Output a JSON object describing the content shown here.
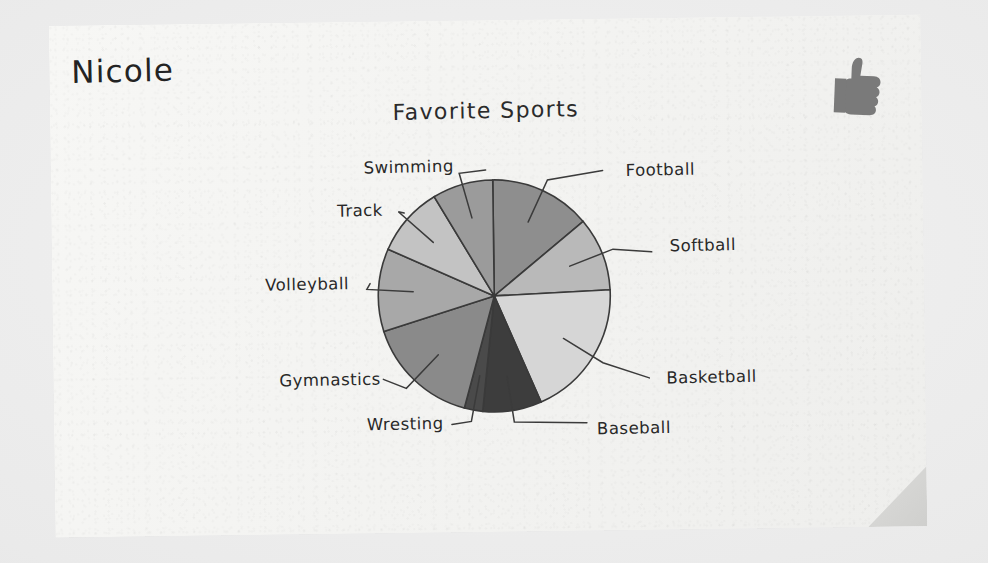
{
  "scene": {
    "background_color": "#eeeeee",
    "paper_color": "#f4f4f2",
    "fold_color": "#d6d6d4"
  },
  "student_name": "Nicole",
  "stamp": {
    "icon": "thumbs-up-icon",
    "color": "#7a7a7a"
  },
  "chart_data": {
    "type": "pie",
    "title": "Favorite Sports",
    "xlabel": "",
    "ylabel": "",
    "grid": false,
    "legend_position": "labels-with-leader-lines",
    "start_angle_deg": 0,
    "direction": "clockwise",
    "categories": [
      "Football",
      "Softball",
      "Basketball",
      "Baseball",
      "Wresting",
      "Gymnastics",
      "Volleyball",
      "Track",
      "Swimming"
    ],
    "values": [
      15.3,
      11.1,
      20.8,
      8.9,
      2.8,
      17.2,
      12.5,
      10.6,
      9.2
    ],
    "slice_angles_deg": [
      55,
      40,
      75,
      32,
      10,
      62,
      45,
      38,
      33
    ],
    "colors": [
      "#8e8e8e",
      "#b9b9b9",
      "#d6d6d6",
      "#3d3d3d",
      "#4a4a4a",
      "#8a8a8a",
      "#a8a8a8",
      "#c3c3c3",
      "#9b9b9b"
    ],
    "labels": [
      {
        "name": "Football",
        "text": "Football",
        "side": "right"
      },
      {
        "name": "Softball",
        "text": "Softball",
        "side": "right"
      },
      {
        "name": "Basketball",
        "text": "Basketball",
        "side": "right"
      },
      {
        "name": "Baseball",
        "text": "Baseball",
        "side": "bottom"
      },
      {
        "name": "Wresting",
        "text": "Wresting",
        "side": "bottom"
      },
      {
        "name": "Gymnastics",
        "text": "Gymnastics",
        "side": "left"
      },
      {
        "name": "Volleyball",
        "text": "Volleyball",
        "side": "left"
      },
      {
        "name": "Track",
        "text": "Track",
        "side": "left"
      },
      {
        "name": "Swimming",
        "text": "Swimming",
        "side": "left"
      }
    ]
  }
}
